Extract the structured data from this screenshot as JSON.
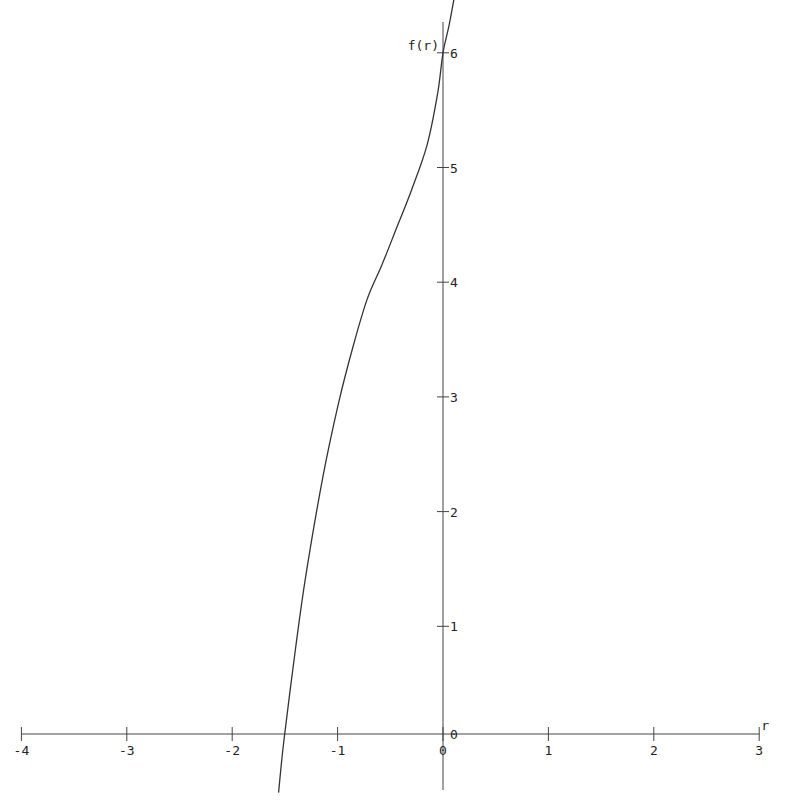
{
  "chart_data": {
    "type": "line",
    "title": "",
    "xlabel": "r",
    "ylabel": "f(r)",
    "xlim": [
      -4,
      3
    ],
    "ylim": [
      -0.4,
      6.2
    ],
    "grid": false,
    "legend": null,
    "x_ticks": [
      -4,
      -3,
      -2,
      -1,
      0,
      1,
      2,
      3
    ],
    "y_ticks": [
      0,
      1,
      2,
      3,
      4,
      5,
      6
    ],
    "x_tick_labels": [
      "-4",
      "-3",
      "-2",
      "-1",
      "0",
      "1",
      "2",
      "3"
    ],
    "y_tick_labels": [
      "0",
      "1",
      "2",
      "3",
      "4",
      "5",
      "6"
    ],
    "series": [
      {
        "name": "f(r)",
        "x": [
          -1.56,
          -1.51,
          -1.4,
          -1.3,
          -1.14,
          -0.99,
          -0.85,
          -0.72,
          -0.58,
          -0.45,
          -0.3,
          -0.15,
          -0.05,
          0.0,
          0.06,
          0.12
        ],
        "y": [
          -0.45,
          0.0,
          0.8,
          1.45,
          2.3,
          2.95,
          3.45,
          3.85,
          4.15,
          4.45,
          4.8,
          5.2,
          5.65,
          6.0,
          6.25,
          6.55
        ]
      }
    ]
  }
}
